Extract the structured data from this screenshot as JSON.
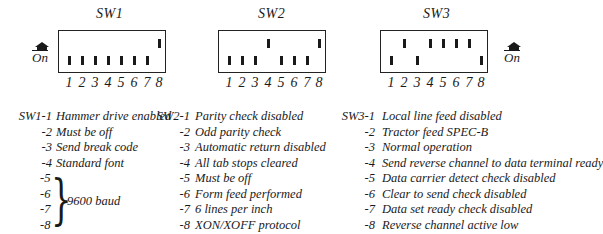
{
  "switches": [
    {
      "name": "SW1",
      "positions": [
        "down",
        "down",
        "down",
        "down",
        "down",
        "down",
        "down",
        "up"
      ],
      "numbers": [
        "1",
        "2",
        "3",
        "4",
        "5",
        "6",
        "7",
        "8"
      ],
      "on_marker_side": "left"
    },
    {
      "name": "SW2",
      "positions": [
        "down",
        "down",
        "down",
        "up",
        "down",
        "down",
        "down",
        "up"
      ],
      "numbers": [
        "1",
        "2",
        "3",
        "4",
        "5",
        "6",
        "7",
        "8"
      ],
      "on_marker_side": "none"
    },
    {
      "name": "SW3",
      "positions": [
        "down",
        "up",
        "down",
        "up",
        "up",
        "up",
        "up",
        "down"
      ],
      "numbers": [
        "1",
        "2",
        "3",
        "4",
        "5",
        "6",
        "7",
        "8"
      ],
      "on_marker_side": "right"
    }
  ],
  "on_label": "On",
  "legend": {
    "sw1": {
      "rows": [
        {
          "key": "SW1-1",
          "text": "Hammer drive enabled"
        },
        {
          "key": "-2",
          "text": "Must be off"
        },
        {
          "key": "-3",
          "text": "Send break code"
        },
        {
          "key": "-4",
          "text": "Standard font"
        },
        {
          "key": "-5",
          "text": ""
        },
        {
          "key": "-6",
          "text": ""
        },
        {
          "key": "-7",
          "text": ""
        },
        {
          "key": "-8",
          "text": ""
        }
      ],
      "grouped_text": "9600 baud"
    },
    "sw2": {
      "rows": [
        {
          "key": "SW2-1",
          "text": "Parity check disabled"
        },
        {
          "key": "-2",
          "text": "Odd parity check"
        },
        {
          "key": "-3",
          "text": "Automatic return disabled"
        },
        {
          "key": "-4",
          "text": "All tab stops cleared"
        },
        {
          "key": "-5",
          "text": "Must be off"
        },
        {
          "key": "-6",
          "text": "Form feed performed"
        },
        {
          "key": "-7",
          "text": "6 lines per inch"
        },
        {
          "key": "-8",
          "text": "XON/XOFF protocol"
        }
      ]
    },
    "sw3": {
      "rows": [
        {
          "key": "SW3-1",
          "text": "Local line feed disabled"
        },
        {
          "key": "-2",
          "text": "Tractor feed SPEC-B"
        },
        {
          "key": "-3",
          "text": "Normal operation"
        },
        {
          "key": "-4",
          "text": "Send reverse channel to data terminal ready"
        },
        {
          "key": "-5",
          "text": "Data carrier detect check disabled"
        },
        {
          "key": "-6",
          "text": "Clear to send check disabled"
        },
        {
          "key": "-7",
          "text": "Data set ready check disabled"
        },
        {
          "key": "-8",
          "text": "Reverse channel active low"
        }
      ]
    }
  }
}
